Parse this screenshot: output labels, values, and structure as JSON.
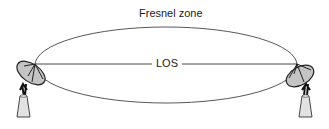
{
  "diagram": {
    "fresnel_label": "Fresnel zone",
    "los_label": "LOS",
    "nodes": [
      {
        "name": "left-antenna",
        "type": "satellite-dish-icon"
      },
      {
        "name": "right-antenna",
        "type": "satellite-dish-icon"
      }
    ],
    "colors": {
      "line": "#333333",
      "dish_fill": "#bdbdbd",
      "cone_fill": "#e0e0e0"
    }
  }
}
